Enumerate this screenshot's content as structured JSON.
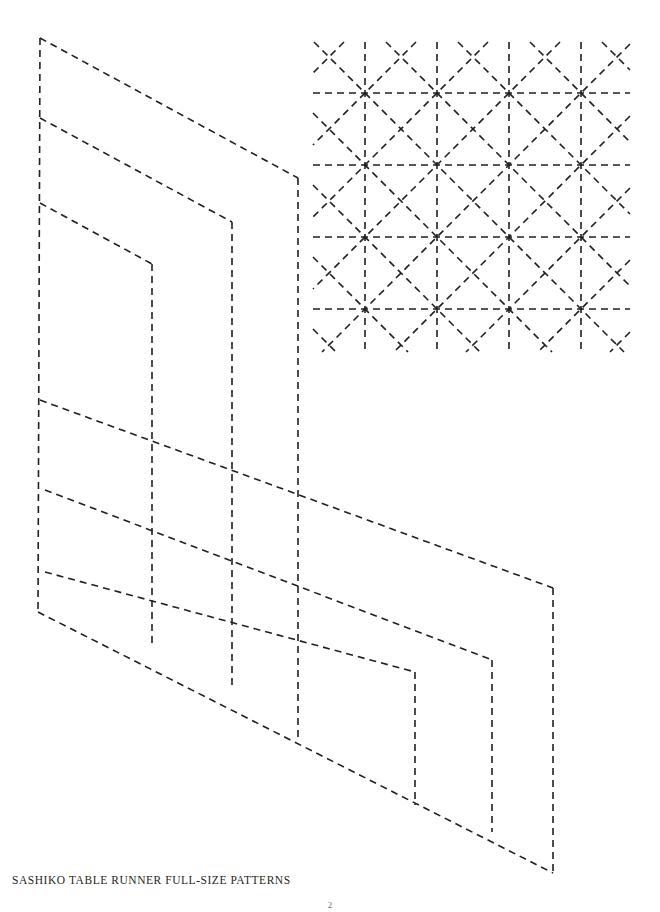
{
  "page": {
    "width": 660,
    "height": 912,
    "background_color": "#ffffff",
    "ink_color": "#231f20",
    "caption": "SASHIKO TABLE RUNNER FULL-SIZE PATTERNS",
    "page_number": "2"
  },
  "line_style": {
    "stroke": "#231f20",
    "stroke_width": 1.6,
    "dash_pattern": "7 5",
    "description": "black dashed stitching guide lines"
  },
  "diagrams": [
    {
      "name": "table-runner-template-outline",
      "type": "nested-parallelogram-template",
      "description": "Isometric nested parallelogram cutting/stitching template for a sashiko table runner",
      "shapes": [
        {
          "name": "outer-upper-panel",
          "points": [
            [
              40,
              38
            ],
            [
              298,
              178
            ],
            [
              298,
              740
            ],
            [
              38,
              612
            ]
          ]
        },
        {
          "name": "upper-band-1",
          "points": [
            [
              40,
              118
            ],
            [
              232,
              222
            ],
            [
              232,
              690
            ],
            [
              40,
              586
            ]
          ]
        },
        {
          "name": "upper-band-2",
          "points": [
            [
              40,
              203
            ],
            [
              152,
              264
            ],
            [
              152,
              648
            ],
            [
              40,
              586
            ]
          ]
        },
        {
          "name": "outer-lower-panel",
          "points": [
            [
              40,
              400
            ],
            [
              553,
              588
            ],
            [
              553,
              873
            ],
            [
              40,
              700
            ]
          ]
        },
        {
          "name": "lower-band-1",
          "points": [
            [
              45,
              490
            ],
            [
              492,
              659
            ],
            [
              492,
              830
            ],
            [
              45,
              680
            ]
          ]
        },
        {
          "name": "lower-band-2",
          "points": [
            [
              45,
              572
            ],
            [
              415,
              672
            ],
            [
              415,
              805
            ],
            [
              45,
              680
            ]
          ]
        }
      ]
    },
    {
      "name": "asanoha-sashiko-pattern",
      "type": "asanoha-star-grid",
      "description": "Hemp-leaf (asanoha) sashiko stitch pattern: grid of eight-pointed stars",
      "grid": {
        "columns": 4,
        "rows": 4,
        "cell_size": 72,
        "origin_x": 365,
        "origin_y": 93,
        "left_bound": 313,
        "right_bound": 630,
        "top_bound": 42,
        "bottom_bound": 352
      }
    }
  ]
}
